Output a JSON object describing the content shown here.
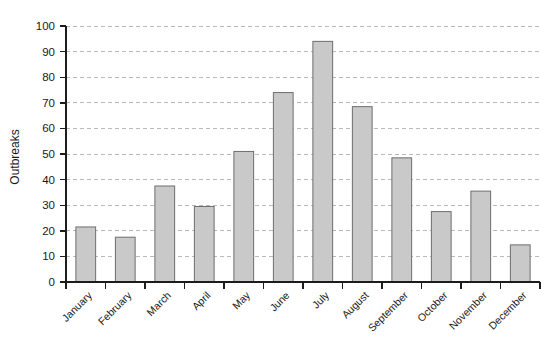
{
  "chart_data": {
    "type": "bar",
    "title": "",
    "subtitle": "",
    "xlabel": "",
    "ylabel": "Outbreaks",
    "categories": [
      "January",
      "February",
      "March",
      "April",
      "May",
      "June",
      "July",
      "August",
      "September",
      "October",
      "November",
      "December"
    ],
    "values": [
      21.5,
      17.5,
      37.5,
      29.5,
      51,
      74,
      94,
      68.5,
      48.5,
      27.5,
      35.5,
      14.5
    ],
    "ylim": [
      0,
      100
    ],
    "yticks": [
      0,
      10,
      20,
      30,
      40,
      50,
      60,
      70,
      80,
      90,
      100
    ],
    "ytick_labels": [
      "0",
      "10",
      "20",
      "30",
      "40",
      "50",
      "60",
      "70",
      "80",
      "90",
      "100"
    ],
    "grid": true,
    "grid_axis": "y",
    "legend": false,
    "legend_position": "none",
    "bar_fill_color": "#c9c9c9",
    "bar_edge_color": "#6e6e6e",
    "gridline_color": "#b9b9b9",
    "axis_color": "#1c1c1c",
    "xtick_label_rotation": 45,
    "series": [
      {
        "name": "Outbreaks",
        "values": [
          21.5,
          17.5,
          37.5,
          29.5,
          51,
          74,
          94,
          68.5,
          48.5,
          27.5,
          35.5,
          14.5
        ]
      }
    ]
  }
}
